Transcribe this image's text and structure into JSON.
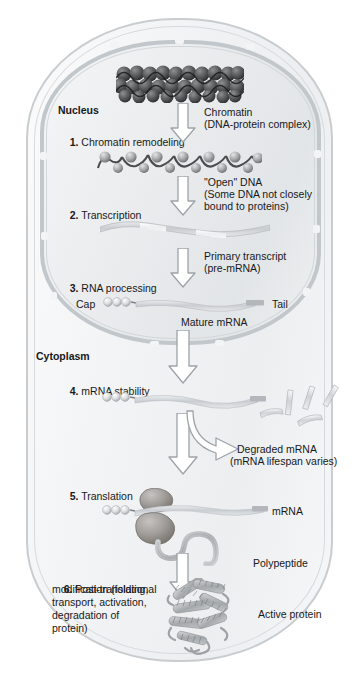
{
  "figure": {
    "compartments": {
      "nucleus_label": "Nucleus",
      "cytoplasm_label": "Cytoplasm"
    },
    "colors": {
      "cell_membrane": "#c9cdd0",
      "nuclear_envelope": "#c2c7cb",
      "cytosol": "#f6f7f8",
      "nucleoplasm": "#e9ebed",
      "arrow_outline": "#9aa0a5",
      "arrow_fill": "#ffffff",
      "text": "#18191a",
      "rna_strand": "#c8ccd0",
      "protein": "#a9aeb3"
    },
    "steps": [
      {
        "num": "1.",
        "label": " Chromatin remodeling"
      },
      {
        "num": "2.",
        "label": " Transcription"
      },
      {
        "num": "3.",
        "label": " RNA processing"
      },
      {
        "num": "4.",
        "label": " mRNA stability"
      },
      {
        "num": "5.",
        "label": " Translation"
      },
      {
        "num": "6.",
        "label": " Post-translational"
      }
    ],
    "step6_lines": [
      "modification (folding,",
      "transport, activation,",
      "degradation of",
      "protein)"
    ],
    "annotations": {
      "chromatin_line1": "Chromatin",
      "chromatin_line2": "(DNA-protein complex)",
      "open_dna_line1": "\"Open\" DNA",
      "open_dna_line2": "(Some DNA not closely",
      "open_dna_line3": "bound to proteins)",
      "primary_transcript_line1": "Primary transcript",
      "primary_transcript_line2": "(pre-mRNA)",
      "cap": "Cap",
      "tail": "Tail",
      "mature_mrna": "Mature mRNA",
      "degraded_line1": "Degraded mRNA",
      "degraded_line2": "(mRNA lifespan varies)",
      "mrna": "mRNA",
      "polypeptide": "Polypeptide",
      "active_protein": "Active protein"
    }
  }
}
